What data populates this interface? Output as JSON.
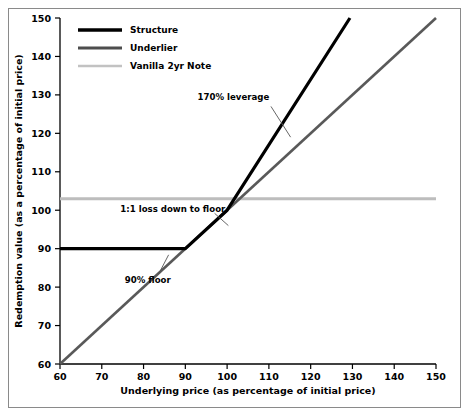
{
  "chart_data": {
    "type": "line",
    "title": "",
    "xlabel": "Underlying price (as percentage of initial price)",
    "ylabel": "Redemption value (as a percentage of initial price)",
    "xlim": [
      60,
      150
    ],
    "ylim": [
      60,
      150
    ],
    "xticks": [
      60,
      70,
      80,
      90,
      100,
      110,
      120,
      130,
      140,
      150
    ],
    "yticks": [
      60,
      70,
      80,
      90,
      100,
      110,
      120,
      130,
      140,
      150
    ],
    "grid": false,
    "legend_position": "top-left",
    "series": [
      {
        "name": "Structure",
        "color": "#000000",
        "width": 3.2,
        "points": [
          [
            60,
            90
          ],
          [
            90,
            90
          ],
          [
            100,
            100
          ],
          [
            129.4,
            150
          ]
        ]
      },
      {
        "name": "Underlier",
        "color": "#595959",
        "width": 2.6,
        "points": [
          [
            60,
            60
          ],
          [
            150,
            150
          ]
        ]
      },
      {
        "name": "Vanilla 2yr Note",
        "color": "#bdbdbd",
        "width": 3.0,
        "points": [
          [
            60,
            103
          ],
          [
            150,
            103
          ]
        ]
      }
    ],
    "annotations": [
      {
        "text": "170% leverage",
        "text_x": 101.5,
        "text_y": 129.5,
        "anchor": "middle",
        "leader": [
          [
            110.5,
            127.0
          ],
          [
            115.2,
            119.0
          ]
        ]
      },
      {
        "text": "1:1 loss down to floor",
        "text_x": 87.0,
        "text_y": 100.2,
        "anchor": "middle",
        "leader": [
          [
            97.0,
            99.2
          ],
          [
            100.3,
            96.0
          ]
        ]
      },
      {
        "text": "90% floor",
        "text_x": 81.0,
        "text_y": 81.8,
        "anchor": "middle",
        "leader": [
          [
            83.6,
            83.4
          ],
          [
            86.0,
            88.4
          ]
        ]
      }
    ]
  },
  "axes": {
    "x_title": "Underlying price (as percentage of initial price)",
    "y_title": "Redemption value (as a percentage of initial price)",
    "x_tick_labels": [
      "60",
      "70",
      "80",
      "90",
      "100",
      "110",
      "120",
      "130",
      "140",
      "150"
    ],
    "y_tick_labels": [
      "60",
      "70",
      "80",
      "90",
      "100",
      "110",
      "120",
      "130",
      "140",
      "150"
    ]
  },
  "legend": {
    "items": [
      {
        "label": "Structure",
        "color": "#000000",
        "thickness": "3.4"
      },
      {
        "label": "Underlier",
        "color": "#4d4d4d",
        "thickness": "3.0"
      },
      {
        "label": "Vanilla 2yr Note",
        "color": "#c2c2c2",
        "thickness": "2.6"
      }
    ]
  },
  "annotation_labels": {
    "leverage": "170% leverage",
    "loss": "1:1 loss down to floor",
    "floor": "90% floor"
  },
  "colors": {
    "structure": "#000000",
    "underlier": "#595959",
    "vanilla": "#bdbdbd",
    "axis": "#000000",
    "frame": "#8a8a8a",
    "background": "#ffffff"
  }
}
